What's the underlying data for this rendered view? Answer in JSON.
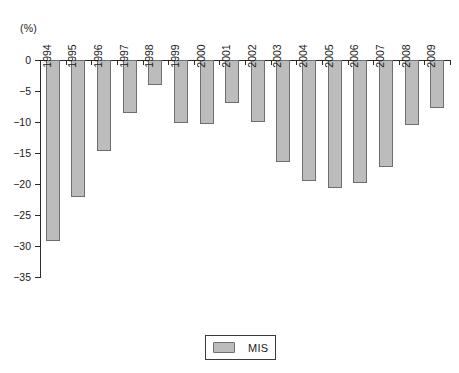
{
  "chart": {
    "unit_label": "(%)",
    "legend": {
      "position": "bottom-center",
      "entries": [
        {
          "name": "MIS",
          "color": "#bcbcbc"
        }
      ]
    }
  },
  "chart_data": {
    "type": "bar",
    "title": "",
    "xlabel": "",
    "ylabel": "(%)",
    "ylim": [
      -35,
      0
    ],
    "yticks": [
      0,
      -5,
      -10,
      -15,
      -20,
      -25,
      -30,
      -35
    ],
    "ytick_labels": [
      "0",
      "−5",
      "−10",
      "−15",
      "−20",
      "−25",
      "−30",
      "−35"
    ],
    "grid": false,
    "categories": [
      "1994",
      "1995",
      "1996",
      "1997",
      "1998",
      "1999",
      "2000",
      "2001",
      "2002",
      "2003",
      "2004",
      "2005",
      "2006",
      "2007",
      "2008",
      "2009"
    ],
    "series": [
      {
        "name": "MIS",
        "color": "#bcbcbc",
        "values": [
          -29.2,
          -22.1,
          -14.7,
          -8.6,
          -4.1,
          -10.1,
          -10.3,
          -7.0,
          -10.0,
          -16.5,
          -19.5,
          -20.6,
          -19.9,
          -17.3,
          -10.5,
          -7.8
        ]
      }
    ]
  }
}
